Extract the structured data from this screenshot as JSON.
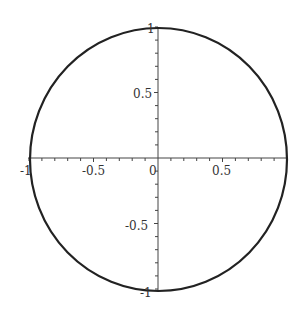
{
  "chart_data": {
    "type": "line",
    "title": "",
    "xlabel": "",
    "ylabel": "",
    "series": [
      {
        "name": "unit circle",
        "x": [
          1,
          0.866,
          0.5,
          0,
          -0.5,
          -0.866,
          -1,
          -0.866,
          -0.5,
          0,
          0.5,
          0.866,
          1
        ],
        "y": [
          0,
          0.5,
          0.866,
          1,
          0.866,
          0.5,
          0,
          -0.5,
          -0.866,
          -1,
          -0.866,
          -0.5,
          0
        ]
      }
    ],
    "xlim": [
      -1,
      1
    ],
    "ylim": [
      -1,
      1
    ],
    "x_ticks": [
      "-1",
      "-0.5",
      "0",
      "0.5"
    ],
    "y_ticks": [
      "1",
      "0.5",
      "-0.5",
      "-1"
    ],
    "minor_tick_step": 0.1,
    "grid": false,
    "legend": "none",
    "axes_through_origin": true
  },
  "colors": {
    "curve": "#222222",
    "axis": "#444444",
    "text": "#333333",
    "background": "#ffffff"
  }
}
